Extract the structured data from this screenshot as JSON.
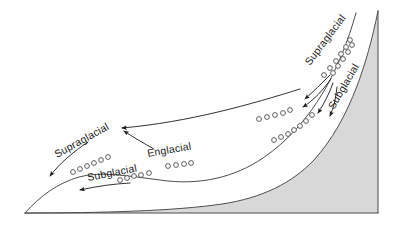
{
  "figure": {
    "name": "glacier-debris-transport-diagram",
    "width": 402,
    "height": 229,
    "background_color": "#ffffff"
  },
  "colors": {
    "bedrock_fill": "#d8d8d8",
    "ice_fill": "#ffffff",
    "outline": "#4d4d4d",
    "arrow": "#1a1a1a",
    "debris_circle_stroke": "#4d4d4d",
    "label_text": "#1a1a1a"
  },
  "labels": [
    {
      "id": "supraglacial-left",
      "text": "Supraglacial",
      "x": 57,
      "y": 158,
      "rotation": -29
    },
    {
      "id": "subglacial-left",
      "text": "Subglacial",
      "x": 88,
      "y": 181,
      "rotation": -11
    },
    {
      "id": "englacial-center",
      "text": "Englacial",
      "x": 148,
      "y": 157,
      "rotation": -10
    },
    {
      "id": "supraglacial-right",
      "text": "Supraglacial",
      "x": 310,
      "y": 66,
      "rotation": -53
    },
    {
      "id": "subglacial-right",
      "text": "Subglacial",
      "x": 334,
      "y": 110,
      "rotation": -60
    }
  ],
  "regions": [
    {
      "id": "bedrock",
      "name": "bedrock-substrate",
      "fill": "#d8d8d8",
      "path": "M 25 213 L 378 213 L 378 11 C 372 40 366 62 357 86 C 346 115 332 140 314 160 C 292 183 262 198 222 204 C 175 211 100 213 25 213 Z"
    },
    {
      "id": "ice",
      "name": "glacier-ice-body",
      "fill": "#ffffff",
      "path": "M 25 213 C 100 213 175 211 222 204 C 262 198 292 183 314 160 C 332 140 346 115 357 86 C 366 62 372 40 378 11 L 356 13 C 348 41 338 67 324 91 C 308 118 288 141 263 158 C 235 177 200 186 160 180 C 128 176 100 171 79 177 C 58 183 40 196 25 213 Z"
    }
  ],
  "surfaces": [
    {
      "id": "ice-surface",
      "name": "ice-upper-surface-line",
      "path": "M 25 213 C 40 196 58 183 79 177 C 100 171 128 176 160 180 C 200 186 235 177 263 158 C 288 141 308 118 324 91 C 338 67 348 41 356 13"
    },
    {
      "id": "bed-surface",
      "name": "bedrock-upper-surface-line",
      "path": "M 25 213 C 100 213 175 211 222 204 C 262 198 292 183 314 160 C 332 140 346 115 357 86 C 366 62 372 40 378 11"
    },
    {
      "id": "mountain-ridge",
      "name": "mountain-ridge-line",
      "path": "M 378 11 L 378 213"
    },
    {
      "id": "ground-baseline",
      "name": "ground-baseline",
      "path": "M 25 213 L 378 213"
    }
  ],
  "arrows": [
    {
      "id": "arrow-supra-left-terminus",
      "name": "transport-arrow-supraglacial-left",
      "path": "M 88 142 C 73 152 60 163 50 176",
      "head_angle": 129
    },
    {
      "id": "arrow-sub-left-terminus",
      "name": "transport-arrow-subglacial-left",
      "path": "M 130 183 C 113 184 98 186 80 190",
      "head_angle": 170
    },
    {
      "id": "arrow-englacial-to-surface",
      "name": "transport-arrow-englacial",
      "path": "M 154 149 C 143 143 133 137 124 131",
      "head_angle": 213
    },
    {
      "id": "arrow-supra-long-left",
      "name": "transport-arrow-supraglacial-long",
      "path": "M 300 89 C 252 104 190 122 122 128",
      "head_angle": 183
    },
    {
      "id": "arrow-right-fan-1",
      "name": "transport-arrow-right-outer",
      "path": "M 330 75 C 322 83 313 92 305 99",
      "head_angle": 137
    },
    {
      "id": "arrow-right-fan-2",
      "name": "transport-arrow-right-middle",
      "path": "M 331 79 C 323 90 314 100 303 107",
      "head_angle": 147
    },
    {
      "id": "arrow-right-fan-3",
      "name": "transport-arrow-right-inner",
      "path": "M 333 83 C 329 94 324 104 318 113",
      "head_angle": 123
    },
    {
      "id": "arrow-right-fan-4",
      "name": "transport-arrow-right-bed",
      "path": "M 337 87 C 336 97 334 107 330 116",
      "head_angle": 106
    }
  ],
  "debris": {
    "radius": 2.4,
    "groups": [
      {
        "id": "supraglacial-debris-left",
        "name": "debris-supraglacial-left",
        "points": [
          [
            73,
            172
          ],
          [
            80,
            169
          ],
          [
            87,
            166
          ],
          [
            94,
            163
          ],
          [
            101,
            160
          ],
          [
            108,
            157
          ]
        ]
      },
      {
        "id": "subglacial-debris-left",
        "name": "debris-subglacial-left",
        "points": [
          [
            120,
            180
          ],
          [
            127,
            178
          ],
          [
            134,
            176
          ],
          [
            141,
            175
          ],
          [
            149,
            173
          ]
        ]
      },
      {
        "id": "englacial-debris-center",
        "name": "debris-englacial-center",
        "points": [
          [
            168,
            166
          ],
          [
            176,
            165
          ],
          [
            184,
            164
          ],
          [
            191,
            163
          ]
        ]
      },
      {
        "id": "englacial-debris-right",
        "name": "debris-englacial-right",
        "points": [
          [
            259,
            119
          ],
          [
            267,
            117
          ],
          [
            275,
            115
          ],
          [
            283,
            113
          ],
          [
            290,
            110
          ]
        ]
      },
      {
        "id": "subglacial-debris-right",
        "name": "debris-subglacial-right",
        "points": [
          [
            274,
            140
          ],
          [
            281,
            137
          ],
          [
            288,
            134
          ],
          [
            294,
            130
          ],
          [
            300,
            126
          ],
          [
            306,
            121
          ],
          [
            312,
            115
          ]
        ]
      },
      {
        "id": "supraglacial-debris-right",
        "name": "debris-supraglacial-right",
        "points": [
          [
            324,
            75
          ],
          [
            330,
            68
          ],
          [
            336,
            61
          ],
          [
            341,
            54
          ],
          [
            346,
            47
          ],
          [
            350,
            40
          ]
        ]
      },
      {
        "id": "supraglacial-debris-right-upper",
        "name": "debris-supraglacial-right-upper",
        "points": [
          [
            333,
            73
          ],
          [
            338,
            66
          ],
          [
            343,
            59
          ],
          [
            348,
            52
          ],
          [
            352,
            45
          ]
        ]
      }
    ]
  }
}
